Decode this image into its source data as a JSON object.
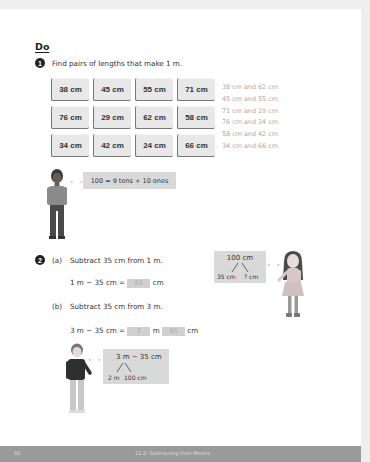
{
  "section": {
    "title": "Do"
  },
  "q1": {
    "number": "1",
    "prompt": "Find pairs of lengths that make 1 m.",
    "cards": [
      "38 cm",
      "45 cm",
      "55 cm",
      "71 cm",
      "76 cm",
      "29 cm",
      "62 cm",
      "58 cm",
      "34 cm",
      "42 cm",
      "24 cm",
      "66 cm"
    ],
    "answers": [
      "38 cm and 62 cm",
      "45 cm and 55 cm",
      "71 cm and 29 cm",
      "76 cm and 24 cm",
      "58 cm and 42 cm",
      "34 cm and 66 cm"
    ],
    "hint_bubble": "100 = 9 tens + 10 ones"
  },
  "q2": {
    "number": "2",
    "a": {
      "label": "(a)",
      "prompt": "Subtract 35 cm from 1 m.",
      "equation_left": "1 m − 35 cm =",
      "answer": "65",
      "unit": "cm"
    },
    "b": {
      "label": "(b)",
      "prompt": "Subtract 35 cm from 3 m.",
      "equation_left": "3 m − 35 cm =",
      "answer_m": "2",
      "unit_m": "m",
      "answer_cm": "65",
      "unit_cm": "cm"
    },
    "girl_bubble": {
      "top": "100 cm",
      "left": "35 cm",
      "right": "? cm"
    },
    "boy_bubble": {
      "top": "3 m − 35 cm",
      "left": "2 m",
      "right": "100 cm"
    }
  },
  "footer": {
    "page_number": "92",
    "title": "11.2: Subtracting from Meters"
  }
}
